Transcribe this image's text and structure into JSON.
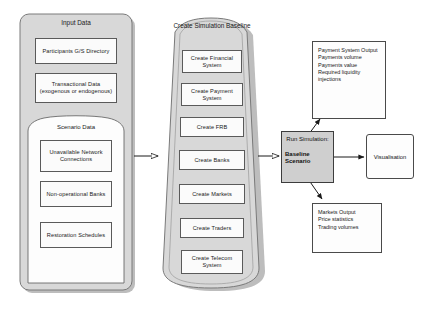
{
  "diagram": {
    "colors": {
      "container_fill": "#d8d8d8",
      "container_stroke": "#7a7a7a",
      "leaf_fill": "#fbfbfb",
      "leaf_stroke": "#5a5a5a",
      "sim_fill": "#cfcfcf",
      "shadow": "#bdbdbd",
      "arrow": "#1a1a1a",
      "background": "#ffffff"
    }
  },
  "input_data": {
    "title": "Input Data",
    "items": [
      {
        "label": "Participants G/S Directory"
      },
      {
        "label": "Transactional Data (exogenous or endogenous)"
      }
    ],
    "scenario": {
      "title": "Scenario Data",
      "items": [
        {
          "label": "Unavailable Network Connections"
        },
        {
          "label": "Non-operational Banks"
        },
        {
          "label": "Restoration Schedules"
        }
      ]
    }
  },
  "create_baseline": {
    "title": "Create Simulation Baseline",
    "items": [
      {
        "label": "Create Financial System"
      },
      {
        "label": "Create Payment System"
      },
      {
        "label": "Create FRB"
      },
      {
        "label": "Create Banks"
      },
      {
        "label": "Create Markets"
      },
      {
        "label": "Create Traders"
      },
      {
        "label": "Create Telecom System"
      }
    ]
  },
  "simulation": {
    "run_label": "Run Simulation:",
    "scenario_label": "Baseline Scenario"
  },
  "payment_output": {
    "title": "Payment System Output",
    "lines": [
      "Payments volume",
      "Payments value",
      "Required liquidity",
      "injections"
    ]
  },
  "markets_output": {
    "title": "Markets Output",
    "lines": [
      "Price statistics",
      "Trading volumes"
    ]
  },
  "visualisation": {
    "label": "Visualisation"
  }
}
